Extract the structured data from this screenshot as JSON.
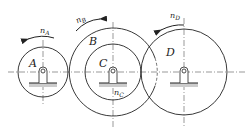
{
  "diagram": {
    "type": "gear-train",
    "gears": [
      {
        "id": "A",
        "label": "A",
        "speed_label": "n",
        "speed_sub": "A"
      },
      {
        "id": "B",
        "label": "B",
        "speed_label": "n",
        "speed_sub": "B"
      },
      {
        "id": "C",
        "label": "C",
        "speed_label": "n",
        "speed_sub": "C"
      },
      {
        "id": "D",
        "label": "D",
        "speed_label": "n",
        "speed_sub": "D"
      }
    ],
    "colors": {
      "line": "#222222",
      "ground": "#cccccc",
      "centerline": "#555555"
    }
  }
}
